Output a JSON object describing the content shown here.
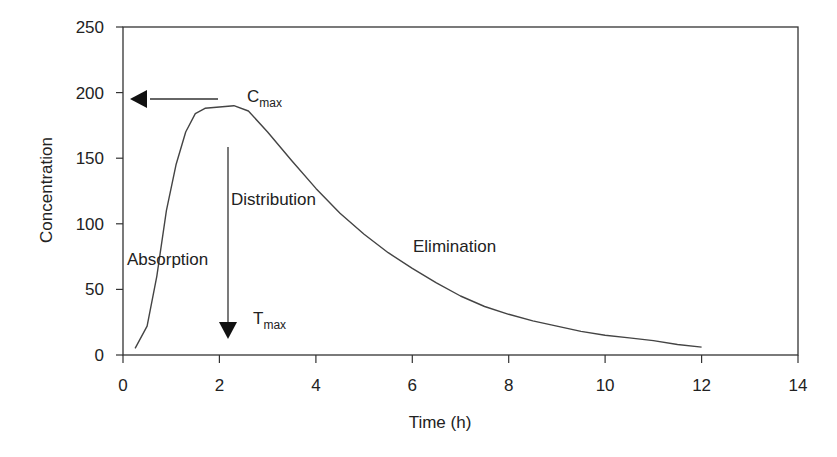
{
  "chart_data": {
    "type": "line",
    "title": "",
    "xlabel": "Time (h)",
    "ylabel": "Concentration",
    "xlim": [
      0,
      14
    ],
    "ylim": [
      0,
      250
    ],
    "xticks": [
      0,
      2,
      4,
      6,
      8,
      10,
      12,
      14
    ],
    "yticks": [
      0,
      50,
      100,
      150,
      200,
      250
    ],
    "grid": false,
    "legend": null,
    "series": [
      {
        "name": "Plasma concentration",
        "x": [
          0.25,
          0.5,
          0.7,
          0.9,
          1.1,
          1.3,
          1.5,
          1.7,
          2.0,
          2.3,
          2.6,
          3.0,
          3.5,
          4.0,
          4.5,
          5.0,
          5.5,
          6.0,
          6.5,
          7.0,
          7.5,
          8.0,
          8.5,
          9.0,
          9.5,
          10.0,
          10.5,
          11.0,
          11.5,
          12.0
        ],
        "y": [
          5,
          22,
          60,
          110,
          145,
          170,
          184,
          188,
          189,
          190,
          186,
          170,
          148,
          127,
          108,
          92,
          78,
          66,
          55,
          45,
          37,
          31,
          26,
          22,
          18,
          15,
          13,
          11,
          8,
          6
        ]
      }
    ],
    "annotations": [
      {
        "text": "C",
        "sub": "max",
        "x": 2.2,
        "y": 192,
        "kind": "horizontal-arrow-to-y-axis",
        "arrow_y": 195
      },
      {
        "text": "T",
        "sub": "max",
        "x": 2.2,
        "y": 25,
        "kind": "vertical-arrow-to-x-axis",
        "arrow_x": 2.15
      },
      {
        "text": "Distribution",
        "x": 2.3,
        "y": 120
      },
      {
        "text": "Absorption",
        "x": 0.05,
        "y": 72
      },
      {
        "text": "Elimination",
        "x": 6.4,
        "y": 83
      }
    ]
  },
  "labels": {
    "x_axis_title": "Time (h)",
    "y_axis_title": "Concentration",
    "x_ticks": [
      "0",
      "2",
      "4",
      "6",
      "8",
      "10",
      "12",
      "14"
    ],
    "y_ticks": [
      "0",
      "50",
      "100",
      "150",
      "200",
      "250"
    ],
    "cmax_main": "C",
    "cmax_sub": "max",
    "tmax_main": "T",
    "tmax_sub": "max",
    "distribution": "Distribution",
    "absorption": "Absorption",
    "elimination": "Elimination"
  }
}
